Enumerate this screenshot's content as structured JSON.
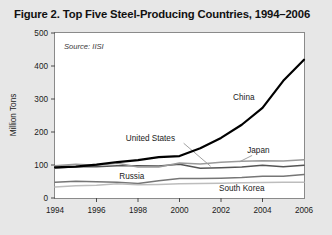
{
  "figure": {
    "title": "Figure 2. Top Five Steel-Producing Countries, 1994–2006",
    "source_note": "Source: IISI"
  },
  "colors": {
    "page_background": "#e7e7e7",
    "plot_background": "#ffffff",
    "plot_border": "#888888",
    "axis_text": "#1a1a1a",
    "china": "#000000",
    "united_states": "#555555",
    "japan": "#9a9a9a",
    "russia": "#767676",
    "south_korea": "#bdbdbd",
    "leader_line": "#8a8a8a"
  },
  "chart_data": {
    "type": "line",
    "title": "Figure 2. Top Five Steel-Producing Countries, 1994–2006",
    "xlabel": "",
    "ylabel": "Million Tons",
    "xlim": [
      1994,
      2006
    ],
    "ylim": [
      0,
      500
    ],
    "yticks": [
      0,
      100,
      200,
      300,
      400,
      500
    ],
    "xticks": [
      1994,
      1996,
      1998,
      2000,
      2002,
      2004,
      2006
    ],
    "xtick_labels": [
      "1994",
      "1996",
      "1998",
      "2000",
      "2002",
      "2004",
      "2006"
    ],
    "ytick_labels": [
      "0",
      "100",
      "200",
      "300",
      "400",
      "500"
    ],
    "grid": false,
    "legend": "inline-annotations",
    "annotations": [
      "Source: IISI"
    ],
    "x": [
      1994,
      1995,
      1996,
      1997,
      1998,
      1999,
      2000,
      2001,
      2002,
      2003,
      2004,
      2005,
      2006
    ],
    "series": [
      {
        "name": "China",
        "color": "#000000",
        "width": 2.2,
        "label_x": 2003.1,
        "label_y": 296,
        "values": [
          93,
          95,
          101,
          109,
          115,
          124,
          127,
          151,
          182,
          222,
          273,
          355,
          419
        ]
      },
      {
        "name": "United States",
        "color": "#555555",
        "width": 1.5,
        "label_x": 1998.6,
        "label_y": 173,
        "values": [
          91,
          95,
          95,
          98,
          98,
          97,
          102,
          90,
          92,
          94,
          99,
          95,
          99
        ]
      },
      {
        "name": "Japan",
        "color": "#9a9a9a",
        "width": 1.5,
        "label_x": 2003.8,
        "label_y": 137,
        "values": [
          98,
          102,
          99,
          105,
          94,
          94,
          106,
          103,
          108,
          111,
          113,
          112,
          116
        ]
      },
      {
        "name": "Russia",
        "color": "#767676",
        "width": 1.5,
        "label_x": 1997.7,
        "label_y": 57,
        "values": [
          48,
          51,
          49,
          48,
          44,
          52,
          59,
          59,
          60,
          62,
          66,
          66,
          71
        ]
      },
      {
        "name": "South Korea",
        "color": "#bdbdbd",
        "width": 1.5,
        "label_x": 2003.0,
        "label_y": 20,
        "values": [
          33,
          37,
          39,
          43,
          40,
          41,
          43,
          44,
          45,
          46,
          47,
          48,
          48
        ]
      }
    ]
  }
}
